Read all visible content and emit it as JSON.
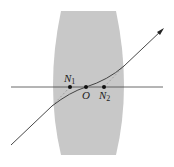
{
  "diagram": {
    "type": "thick lens ray diagram with nodal points",
    "colors": {
      "lens_fill": "#c8c8c8",
      "ray": "#333333",
      "axis": "#444444",
      "dashed": "#888888"
    },
    "labels": {
      "n1": "N",
      "n1_sub": "1",
      "o": "O",
      "n2": "N",
      "n2_sub": "2"
    },
    "points": {
      "N1": [
        70,
        87
      ],
      "O": [
        86,
        87
      ],
      "N2": [
        104,
        87
      ]
    }
  }
}
